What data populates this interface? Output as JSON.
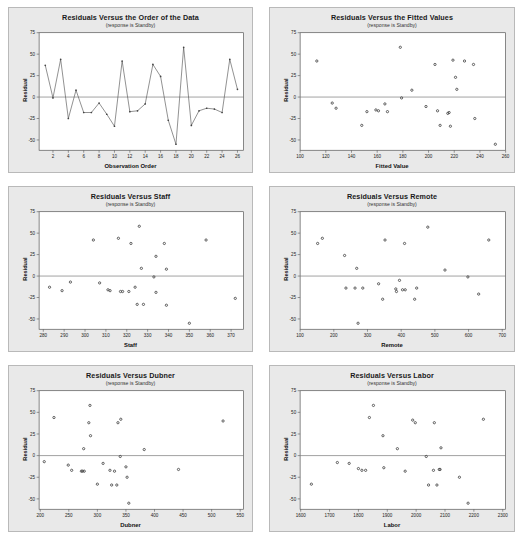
{
  "page": {
    "background": "#ffffff",
    "panel_background": "#e9e9e9",
    "plot_background": "#ffffff",
    "frame_color": "#555555",
    "marker_color": "#444444",
    "line_color": "#555555",
    "zero_line_color": "#777777"
  },
  "shared": {
    "subtitle": "(response is Standby)",
    "ylabel": "Residual",
    "yticks": [
      75,
      50,
      25,
      0,
      -25,
      -50
    ],
    "ylim": [
      -62,
      75
    ]
  },
  "chart_data": [
    {
      "id": "order",
      "type": "line",
      "title": "Residuals Versus the Order of the Data",
      "subtitle": "(response is Standby)",
      "xlabel": "Observation Order",
      "ylabel": "Residual",
      "xticks": [
        2,
        4,
        6,
        8,
        10,
        12,
        14,
        16,
        18,
        20,
        22,
        24,
        26
      ],
      "yticks": [
        75,
        50,
        25,
        0,
        -25,
        -50
      ],
      "xlim": [
        0.2,
        26.8
      ],
      "ylim": [
        -62,
        75
      ],
      "grid": false,
      "legend": "none",
      "zero_line": 0,
      "x": [
        1,
        2,
        3,
        4,
        5,
        6,
        7,
        8,
        9,
        10,
        11,
        12,
        13,
        14,
        15,
        16,
        17,
        18,
        19,
        20,
        21,
        22,
        23,
        24,
        25,
        26
      ],
      "values": [
        37,
        -1,
        44,
        -25,
        8,
        -18,
        -18,
        -7,
        -20,
        -34,
        42,
        -17,
        -16,
        -8,
        38,
        24,
        -27,
        -55,
        58,
        -33,
        -16,
        -13,
        -14,
        -18,
        44,
        9
      ]
    },
    {
      "id": "fitted",
      "type": "scatter",
      "title": "Residuals Versus the Fitted Values",
      "subtitle": "(response is Standby)",
      "xlabel": "Fitted Value",
      "ylabel": "Residual",
      "xticks": [
        100,
        120,
        140,
        160,
        180,
        200,
        220,
        240,
        260
      ],
      "yticks": [
        75,
        50,
        25,
        0,
        -25,
        -50
      ],
      "xlim": [
        100,
        260
      ],
      "ylim": [
        -62,
        75
      ],
      "grid": false,
      "legend": "none",
      "zero_line": 0,
      "points": [
        [
          113,
          42
        ],
        [
          125,
          -7
        ],
        [
          128,
          -13
        ],
        [
          148,
          -33
        ],
        [
          152,
          -17
        ],
        [
          159,
          -15
        ],
        [
          161,
          -16
        ],
        [
          166,
          -8
        ],
        [
          168,
          -17
        ],
        [
          178,
          58
        ],
        [
          179,
          -1
        ],
        [
          187,
          8
        ],
        [
          198,
          -11
        ],
        [
          205,
          38
        ],
        [
          207,
          -16
        ],
        [
          209,
          -33
        ],
        [
          215,
          -19
        ],
        [
          216,
          -18
        ],
        [
          217,
          -34
        ],
        [
          219,
          43
        ],
        [
          221,
          23
        ],
        [
          222,
          9
        ],
        [
          228,
          42
        ],
        [
          235,
          38
        ],
        [
          236,
          -25
        ],
        [
          252,
          -55
        ]
      ]
    },
    {
      "id": "staff",
      "type": "scatter",
      "title": "Residuals Versus Staff",
      "subtitle": "(response is Standby)",
      "xlabel": "Staff",
      "ylabel": "Residual",
      "xticks": [
        280,
        290,
        300,
        310,
        320,
        330,
        340,
        350,
        360,
        370
      ],
      "yticks": [
        75,
        50,
        25,
        0,
        -25,
        -50
      ],
      "xlim": [
        278,
        376
      ],
      "ylim": [
        -62,
        75
      ],
      "grid": false,
      "legend": "none",
      "zero_line": 0,
      "points": [
        [
          283,
          -13
        ],
        [
          289,
          -17
        ],
        [
          293,
          -7
        ],
        [
          304,
          42
        ],
        [
          307,
          -8
        ],
        [
          311,
          -16
        ],
        [
          312,
          -17
        ],
        [
          316,
          44
        ],
        [
          317,
          -18
        ],
        [
          318,
          -18
        ],
        [
          321,
          -18
        ],
        [
          322,
          38
        ],
        [
          324,
          -13
        ],
        [
          325,
          -33
        ],
        [
          326,
          58
        ],
        [
          327,
          9
        ],
        [
          328,
          -33
        ],
        [
          333,
          -1
        ],
        [
          334,
          23
        ],
        [
          334,
          -19
        ],
        [
          338,
          38
        ],
        [
          339,
          8
        ],
        [
          339,
          -34
        ],
        [
          350,
          -55
        ],
        [
          358,
          42
        ],
        [
          372,
          -26
        ]
      ]
    },
    {
      "id": "remote",
      "type": "scatter",
      "title": "Residuals Versus Remote",
      "subtitle": "(response is Standby)",
      "xlabel": "Remote",
      "ylabel": "Residual",
      "xticks": [
        100,
        200,
        300,
        400,
        500,
        600,
        700
      ],
      "yticks": [
        75,
        50,
        25,
        0,
        -25,
        -50
      ],
      "xlim": [
        100,
        710
      ],
      "ylim": [
        -62,
        75
      ],
      "grid": false,
      "legend": "none",
      "zero_line": 0,
      "points": [
        [
          152,
          38
        ],
        [
          166,
          44
        ],
        [
          232,
          24
        ],
        [
          236,
          -14
        ],
        [
          263,
          -14
        ],
        [
          268,
          9
        ],
        [
          272,
          -55
        ],
        [
          286,
          -14
        ],
        [
          333,
          -9
        ],
        [
          345,
          -27
        ],
        [
          352,
          42
        ],
        [
          384,
          -15
        ],
        [
          386,
          -18
        ],
        [
          395,
          -5
        ],
        [
          404,
          -16
        ],
        [
          410,
          38
        ],
        [
          412,
          -16
        ],
        [
          440,
          -27
        ],
        [
          446,
          -14
        ],
        [
          479,
          57
        ],
        [
          530,
          7
        ],
        [
          598,
          -1
        ],
        [
          630,
          -21
        ],
        [
          660,
          42
        ]
      ]
    },
    {
      "id": "dubner",
      "type": "scatter",
      "title": "Residuals Versus Dubner",
      "subtitle": "(response is Standby)",
      "xlabel": "Dubner",
      "ylabel": "Residual",
      "xticks": [
        200,
        250,
        300,
        350,
        400,
        450,
        500,
        550
      ],
      "yticks": [
        75,
        50,
        25,
        0,
        -25,
        -50
      ],
      "xlim": [
        198,
        556
      ],
      "ylim": [
        -62,
        75
      ],
      "grid": false,
      "legend": "none",
      "zero_line": 0,
      "points": [
        [
          207,
          -7
        ],
        [
          224,
          44
        ],
        [
          249,
          -11
        ],
        [
          255,
          -17
        ],
        [
          272,
          -18
        ],
        [
          274,
          -18
        ],
        [
          276,
          8
        ],
        [
          277,
          -18
        ],
        [
          285,
          38
        ],
        [
          287,
          58
        ],
        [
          288,
          23
        ],
        [
          300,
          -33
        ],
        [
          310,
          -9
        ],
        [
          322,
          -17
        ],
        [
          325,
          -34
        ],
        [
          330,
          -18
        ],
        [
          334,
          -34
        ],
        [
          336,
          38
        ],
        [
          340,
          -1
        ],
        [
          341,
          42
        ],
        [
          350,
          -13
        ],
        [
          352,
          -25
        ],
        [
          355,
          -55
        ],
        [
          382,
          7
        ],
        [
          442,
          -16
        ],
        [
          520,
          40
        ]
      ]
    },
    {
      "id": "labor",
      "type": "scatter",
      "title": "Residuals Versus Labor",
      "subtitle": "(response is Standby)",
      "xlabel": "Labor",
      "ylabel": "Residual",
      "xticks": [
        1600,
        1700,
        1800,
        1900,
        2000,
        2100,
        2200,
        2300
      ],
      "yticks": [
        75,
        50,
        25,
        0,
        -25,
        -50
      ],
      "xlim": [
        1598,
        2310
      ],
      "ylim": [
        -62,
        75
      ],
      "grid": false,
      "legend": "none",
      "zero_line": 0,
      "points": [
        [
          1637,
          -33
        ],
        [
          1727,
          -8
        ],
        [
          1768,
          -9
        ],
        [
          1800,
          -15
        ],
        [
          1812,
          -17
        ],
        [
          1825,
          -17
        ],
        [
          1838,
          44
        ],
        [
          1852,
          58
        ],
        [
          1885,
          23
        ],
        [
          1888,
          -14
        ],
        [
          1935,
          8
        ],
        [
          1962,
          -18
        ],
        [
          1988,
          41
        ],
        [
          1997,
          38
        ],
        [
          2035,
          -1
        ],
        [
          2043,
          -34
        ],
        [
          2060,
          -17
        ],
        [
          2063,
          38
        ],
        [
          2072,
          -34
        ],
        [
          2080,
          -16
        ],
        [
          2083,
          -16
        ],
        [
          2086,
          9
        ],
        [
          2150,
          -25
        ],
        [
          2180,
          -55
        ],
        [
          2233,
          42
        ]
      ]
    }
  ]
}
